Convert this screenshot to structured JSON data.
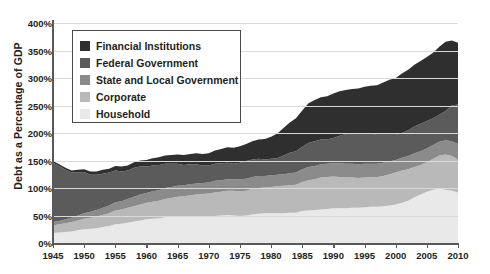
{
  "chart_data": {
    "type": "area",
    "title": "",
    "subtitle": "",
    "xlabel": "",
    "ylabel": "Debt as a Percentage of GDP",
    "xlim": [
      1945,
      2010
    ],
    "ylim": [
      0,
      400
    ],
    "grid": true,
    "stacked": true,
    "legend_position": "upper-left-inside",
    "ytick_labels": [
      "0%",
      "50%",
      "100%",
      "150%",
      "200%",
      "250%",
      "300%",
      "350%",
      "400%"
    ],
    "ytick_values": [
      0,
      50,
      100,
      150,
      200,
      250,
      300,
      350,
      400
    ],
    "xtick_labels": [
      "1945",
      "1950",
      "1955",
      "1960",
      "1965",
      "1970",
      "1975",
      "1980",
      "1985",
      "1990",
      "1995",
      "2000",
      "2005",
      "2010"
    ],
    "xtick_values": [
      1945,
      1950,
      1955,
      1960,
      1965,
      1970,
      1975,
      1980,
      1985,
      1990,
      1995,
      2000,
      2005,
      2010
    ],
    "x": [
      1945,
      1946,
      1947,
      1948,
      1949,
      1950,
      1951,
      1952,
      1953,
      1954,
      1955,
      1956,
      1957,
      1958,
      1959,
      1960,
      1961,
      1962,
      1963,
      1964,
      1965,
      1966,
      1967,
      1968,
      1969,
      1970,
      1971,
      1972,
      1973,
      1974,
      1975,
      1976,
      1977,
      1978,
      1979,
      1980,
      1981,
      1982,
      1983,
      1984,
      1985,
      1986,
      1987,
      1988,
      1989,
      1990,
      1991,
      1992,
      1993,
      1994,
      1995,
      1996,
      1997,
      1998,
      1999,
      2000,
      2001,
      2002,
      2003,
      2004,
      2005,
      2006,
      2007,
      2008,
      2009,
      2010
    ],
    "series": [
      {
        "name": "Household",
        "color": "#e9e9e9",
        "values": [
          18,
          19,
          20,
          21,
          23,
          25,
          26,
          27,
          29,
          31,
          34,
          35,
          37,
          39,
          41,
          43,
          44,
          45,
          47,
          48,
          49,
          49,
          49,
          49,
          49,
          48,
          49,
          50,
          51,
          50,
          49,
          50,
          52,
          53,
          54,
          54,
          54,
          54,
          55,
          55,
          58,
          59,
          60,
          61,
          62,
          63,
          63,
          63,
          64,
          64,
          65,
          66,
          66,
          67,
          68,
          70,
          73,
          77,
          83,
          88,
          93,
          97,
          99,
          97,
          95,
          92
        ]
      },
      {
        "name": "Corporate",
        "color": "#b9b9b9",
        "values": [
          14,
          15,
          16,
          17,
          18,
          19,
          20,
          21,
          22,
          23,
          25,
          26,
          27,
          28,
          29,
          30,
          31,
          32,
          33,
          34,
          35,
          36,
          38,
          39,
          40,
          42,
          43,
          43,
          44,
          45,
          45,
          45,
          46,
          47,
          47,
          48,
          49,
          50,
          50,
          51,
          53,
          55,
          56,
          58,
          58,
          58,
          57,
          56,
          55,
          54,
          54,
          54,
          54,
          55,
          57,
          58,
          59,
          57,
          55,
          54,
          54,
          56,
          60,
          64,
          63,
          60
        ]
      },
      {
        "name": "State and Local Government",
        "color": "#8b8b8b",
        "values": [
          6,
          6,
          7,
          8,
          9,
          10,
          11,
          12,
          13,
          14,
          15,
          15,
          16,
          17,
          18,
          18,
          19,
          19,
          20,
          20,
          20,
          20,
          20,
          20,
          20,
          20,
          21,
          21,
          21,
          21,
          22,
          22,
          22,
          22,
          21,
          21,
          21,
          21,
          22,
          22,
          23,
          24,
          24,
          24,
          24,
          24,
          25,
          25,
          25,
          25,
          25,
          24,
          24,
          24,
          23,
          23,
          23,
          24,
          25,
          25,
          25,
          25,
          25,
          26,
          27,
          28
        ]
      },
      {
        "name": "Federal Government",
        "color": "#5b5b5b",
        "values": [
          108,
          100,
          90,
          82,
          78,
          75,
          67,
          64,
          62,
          60,
          58,
          54,
          52,
          53,
          51,
          48,
          47,
          46,
          44,
          42,
          40,
          37,
          36,
          35,
          32,
          31,
          31,
          31,
          30,
          28,
          30,
          32,
          32,
          31,
          30,
          30,
          30,
          34,
          37,
          39,
          41,
          44,
          45,
          45,
          44,
          46,
          50,
          54,
          56,
          56,
          56,
          55,
          53,
          51,
          49,
          46,
          45,
          47,
          49,
          50,
          50,
          49,
          49,
          53,
          65,
          72
        ]
      },
      {
        "name": "Financial Institutions",
        "color": "#2f2f2f",
        "values": [
          3,
          3,
          4,
          4,
          5,
          5,
          6,
          6,
          7,
          7,
          8,
          9,
          9,
          10,
          11,
          12,
          13,
          14,
          15,
          16,
          17,
          18,
          19,
          20,
          21,
          22,
          24,
          26,
          28,
          29,
          30,
          31,
          33,
          35,
          37,
          40,
          45,
          50,
          55,
          60,
          66,
          72,
          75,
          77,
          79,
          81,
          81,
          80,
          80,
          82,
          84,
          87,
          90,
          95,
          100,
          103,
          108,
          110,
          112,
          114,
          116,
          119,
          124,
          126,
          118,
          112
        ]
      }
    ]
  },
  "legend": {
    "items": [
      {
        "label": "Financial Institutions",
        "color": "#2f2f2f"
      },
      {
        "label": "Federal Government",
        "color": "#5b5b5b"
      },
      {
        "label": "State and Local Government",
        "color": "#8b8b8b"
      },
      {
        "label": "Corporate",
        "color": "#b9b9b9"
      },
      {
        "label": "Household",
        "color": "#e9e9e9"
      }
    ]
  },
  "axes": {
    "y_title": "Debt as a Percentage of GDP"
  }
}
